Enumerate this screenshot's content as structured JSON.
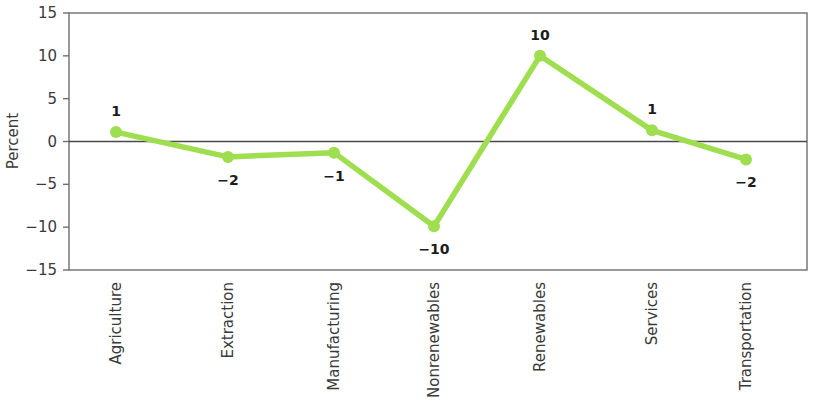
{
  "chart_data": {
    "type": "line",
    "title": "",
    "xlabel": "",
    "ylabel": "Percent",
    "categories": [
      "Agriculture",
      "Extraction",
      "Manufacturing",
      "Nonrenewables",
      "Renewables",
      "Services",
      "Transportation"
    ],
    "values": [
      1,
      -2,
      -1,
      -10,
      10,
      1,
      -2
    ],
    "point_values": [
      1.1,
      -1.8,
      -1.3,
      -9.9,
      10.0,
      1.3,
      -2.1
    ],
    "data_labels": [
      "1",
      "−2",
      "−1",
      "−10",
      "10",
      "1",
      "−2"
    ],
    "label_positions": [
      "above",
      "below",
      "below",
      "below",
      "above",
      "above",
      "below"
    ],
    "ylim": [
      -15,
      15
    ],
    "yticks": [
      15,
      10,
      5,
      0,
      -5,
      -10,
      -15
    ],
    "ytick_labels": [
      "15",
      "10",
      "5",
      "0",
      "−5",
      "−10",
      "−15"
    ],
    "grid": false,
    "legend": "none",
    "series_color": "#9ede4f",
    "marker_color": "#9ede4f",
    "zero_line_color": "#4a4a4a",
    "frame_color": "#6e6e6e",
    "label_color": "#1c1c1c",
    "axis_text_color": "#3a3a3a"
  },
  "plot_geometry": {
    "left": 69,
    "right": 807,
    "top": 13,
    "bottom": 270,
    "x_positions": [
      116,
      228,
      334,
      434,
      540,
      652,
      746
    ]
  }
}
